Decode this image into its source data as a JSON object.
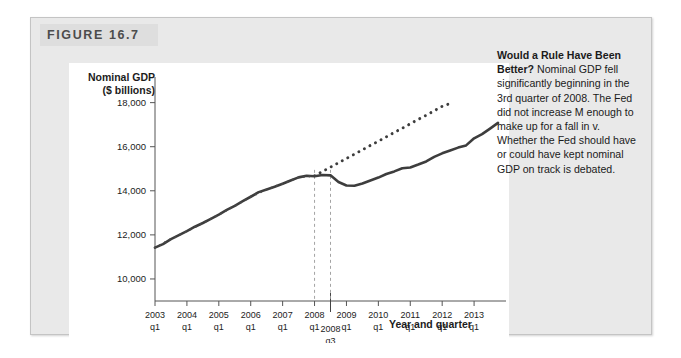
{
  "figure": {
    "tag": "FIGURE 16.7"
  },
  "caption": {
    "lead": "Would a Rule Have Been Better?",
    "body": " Nominal GDP fell significantly beginning in the 3rd quarter of 2008. The Fed did not increase M enough to make up for a fall in v. Whether the Fed should have or could have kept nominal GDP on track is debated."
  },
  "chart_data": {
    "type": "line",
    "title": "",
    "ylabel_line1": "Nominal GDP",
    "ylabel_line2": "($ billions)",
    "xlabel": "Year and quarter",
    "ylim": [
      9000,
      18800
    ],
    "yticks": [
      10000,
      12000,
      14000,
      16000,
      18000
    ],
    "ytick_labels": [
      "10,000",
      "12,000",
      "14,000",
      "16,000",
      "18,000"
    ],
    "xlim": [
      2003.0,
      2014.0
    ],
    "xticks": [
      2003,
      2004,
      2005,
      2006,
      2007,
      2008,
      2009,
      2010,
      2011,
      2012,
      2013
    ],
    "xtick_year_labels": [
      "2003",
      "2004",
      "2005",
      "2006",
      "2007",
      "2008",
      "2009",
      "2010",
      "2011",
      "2012",
      "2013"
    ],
    "xtick_quarter_label": "q1",
    "grid": false,
    "legend": "none",
    "annotations": [
      {
        "name": "marker-2008-q3",
        "line1": "2008",
        "line2": "q3",
        "x": 2008.5
      },
      {
        "name": "dashed-marker-2008-q1",
        "x": 2008.0
      },
      {
        "name": "dashed-marker-2008-q3",
        "x": 2008.5
      }
    ],
    "series": [
      {
        "name": "Actual nominal GDP",
        "style": "solid",
        "color": "#3d3d3d",
        "x": [
          2003.0,
          2003.25,
          2003.5,
          2003.75,
          2004.0,
          2004.25,
          2004.5,
          2004.75,
          2005.0,
          2005.25,
          2005.5,
          2005.75,
          2006.0,
          2006.25,
          2006.5,
          2006.75,
          2007.0,
          2007.25,
          2007.5,
          2007.75,
          2008.0,
          2008.25,
          2008.5,
          2008.75,
          2009.0,
          2009.25,
          2009.5,
          2009.75,
          2010.0,
          2010.25,
          2010.5,
          2010.75,
          2011.0,
          2011.25,
          2011.5,
          2011.75,
          2012.0,
          2012.25,
          2012.5,
          2012.75,
          2013.0,
          2013.25,
          2013.5,
          2013.75
        ],
        "y": [
          11420,
          11580,
          11810,
          11990,
          12170,
          12370,
          12540,
          12730,
          12920,
          13130,
          13320,
          13530,
          13730,
          13940,
          14060,
          14180,
          14320,
          14470,
          14610,
          14680,
          14660,
          14720,
          14700,
          14400,
          14240,
          14230,
          14330,
          14470,
          14600,
          14760,
          14880,
          15020,
          15060,
          15190,
          15330,
          15540,
          15700,
          15830,
          15960,
          16060,
          16380,
          16570,
          16820,
          17080
        ]
      },
      {
        "name": "Trend (rule) path",
        "style": "dotted",
        "color": "#3d3d3d",
        "x": [
          2008.0,
          2008.25,
          2008.5,
          2008.75,
          2009.0,
          2009.25,
          2009.5,
          2009.75,
          2010.0,
          2010.25,
          2010.5,
          2010.75,
          2011.0,
          2011.25,
          2011.5,
          2011.75,
          2012.0,
          2012.25
        ],
        "y": [
          14680,
          14880,
          15070,
          15270,
          15470,
          15660,
          15860,
          16060,
          16250,
          16450,
          16650,
          16840,
          17040,
          17240,
          17430,
          17630,
          17830,
          17960
        ]
      },
      {
        "name": "Early-period fitted overlay",
        "style": "dotted-overlay",
        "color": "#4a4a4a",
        "x": [
          2003.0,
          2003.5,
          2004.0,
          2004.5,
          2005.0,
          2005.5,
          2006.0,
          2006.5,
          2007.0,
          2007.5,
          2008.0
        ],
        "y": [
          11420,
          11810,
          12170,
          12540,
          12920,
          13320,
          13730,
          14060,
          14320,
          14610,
          14680
        ]
      }
    ]
  }
}
